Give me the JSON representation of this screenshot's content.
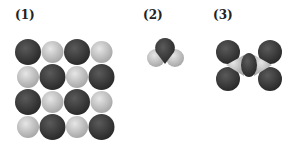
{
  "labels": {
    "one": "(1)",
    "two": "(2)",
    "three": "(3)"
  },
  "colors": {
    "dark": "#3a3a3a",
    "light": "#c4c4c4"
  },
  "grid": {
    "rows": [
      [
        "dark",
        "light",
        "dark",
        "light"
      ],
      [
        "light",
        "dark",
        "light",
        "dark"
      ],
      [
        "dark",
        "light",
        "dark",
        "light"
      ],
      [
        "light",
        "dark",
        "light",
        "dark"
      ]
    ]
  }
}
